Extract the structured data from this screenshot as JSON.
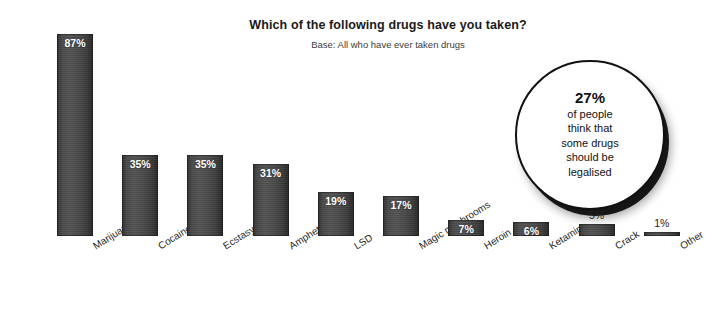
{
  "chart_data": {
    "type": "bar",
    "title": "Which of the following drugs have you taken?",
    "subtitle": "Base: All who have ever taken drugs",
    "xlabel": "",
    "ylabel": "",
    "ylim": [
      0,
      92
    ],
    "grid": false,
    "legend": "none",
    "unit": "%",
    "categories": [
      "Marijuana",
      "Cocaine",
      "Ecstasy",
      "Amphetamines",
      "LSD",
      "Magic mushrooms",
      "Heroin",
      "Ketamine",
      "Crack",
      "Other"
    ],
    "values": [
      87,
      35,
      35,
      31,
      19,
      17,
      7,
      6,
      5,
      1
    ],
    "value_labels": [
      "87%",
      "35%",
      "35%",
      "31%",
      "19%",
      "17%",
      "7%",
      "6%",
      "5%",
      "1%"
    ],
    "label_position": [
      "inside",
      "inside",
      "inside",
      "inside",
      "inside",
      "inside",
      "inside",
      "inside",
      "outside",
      "outside"
    ],
    "bar_color": "#4a4a4a",
    "bar_edge_color": "#1e1e1e",
    "inside_label_color": "#ffffff",
    "outside_label_color": "#222222",
    "background_color": "#ffffff"
  },
  "callout": {
    "percent": "27%",
    "lines": [
      "of people",
      "think that",
      "some drugs",
      "should be",
      "legalised"
    ]
  }
}
